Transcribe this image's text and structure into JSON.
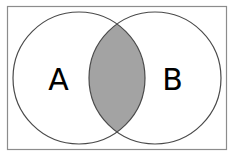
{
  "diagram": {
    "type": "venn",
    "sets": [
      {
        "label": "A"
      },
      {
        "label": "B"
      }
    ],
    "highlighted_region": "A ∩ B",
    "colors": {
      "background": "#ffffff",
      "outline": "#4a4a4a",
      "frame": "#8c8c8c",
      "intersection_fill": "#a3a3a3",
      "label": "#000000"
    }
  }
}
